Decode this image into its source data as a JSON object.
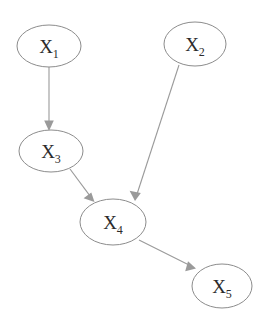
{
  "diagram": {
    "type": "directed-acyclic-graph",
    "title": "",
    "background_color": "#ffffff",
    "node_stroke_color": "#8c8c8c",
    "node_fill_color": "#ffffff",
    "edge_color": "#9a9a9a",
    "label_color": "#2b2b2b",
    "nodes": [
      {
        "id": "X1",
        "base": "X",
        "subscript": "1",
        "label": "X1",
        "cx": 49,
        "cy": 46,
        "rx": 32,
        "ry": 21
      },
      {
        "id": "X2",
        "base": "X",
        "subscript": "2",
        "label": "X2",
        "cx": 195,
        "cy": 44,
        "rx": 31,
        "ry": 22
      },
      {
        "id": "X3",
        "base": "X",
        "subscript": "3",
        "label": "X3",
        "cx": 51,
        "cy": 151,
        "rx": 32,
        "ry": 21
      },
      {
        "id": "X4",
        "base": "X",
        "subscript": "4",
        "label": "X4",
        "cx": 113,
        "cy": 222,
        "rx": 33,
        "ry": 23
      },
      {
        "id": "X5",
        "base": "X",
        "subscript": "5",
        "label": "X5",
        "cx": 222,
        "cy": 286,
        "rx": 30,
        "ry": 22
      }
    ],
    "edges": [
      {
        "from": "X1",
        "to": "X3",
        "x1": 49,
        "y1": 67,
        "x2": 49,
        "y2": 128
      },
      {
        "from": "X3",
        "to": "X4",
        "x1": 70,
        "y1": 169,
        "x2": 93,
        "y2": 200
      },
      {
        "from": "X2",
        "to": "X4",
        "x1": 179,
        "y1": 65,
        "x2": 135,
        "y2": 199
      },
      {
        "from": "X4",
        "to": "X5",
        "x1": 139,
        "y1": 240,
        "x2": 195,
        "y2": 268
      }
    ]
  }
}
